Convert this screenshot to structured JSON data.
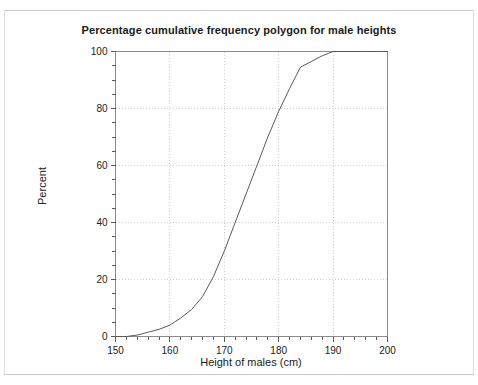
{
  "document": {
    "background_color": "#ffffff",
    "rule_color": "#c9c9c9"
  },
  "chart_data": {
    "type": "line",
    "title": "Percentage cumulative frequency polygon for male heights",
    "xlabel": "Height of males (cm)",
    "ylabel": "Percent",
    "xlim": [
      150,
      200
    ],
    "ylim": [
      0,
      100
    ],
    "x_major_ticks": [
      150,
      160,
      170,
      180,
      190,
      200
    ],
    "x_major_tick_labels": [
      "150",
      "160",
      "170",
      "180",
      "190",
      "200"
    ],
    "x_minor_tick_step": 2,
    "y_major_ticks": [
      0,
      20,
      40,
      60,
      80,
      100
    ],
    "y_major_tick_labels": [
      "0",
      "20",
      "40",
      "60",
      "80",
      "100"
    ],
    "y_minor_tick_step": 5,
    "grid": true,
    "grid_style": "dotted",
    "grid_color": "#cfcfcf",
    "legend": false,
    "line_color": "#5a5a5a",
    "line_width": 1,
    "frame_color": "#8a8a8a",
    "series": [
      {
        "name": "Cumulative percentage of male heights",
        "x": [
          150,
          152,
          154,
          156,
          158,
          160,
          162,
          164,
          166,
          168,
          170,
          172,
          174,
          176,
          178,
          180,
          182,
          184,
          186,
          188,
          190,
          192,
          194,
          196,
          198,
          200
        ],
        "values": [
          0,
          0,
          0.5,
          1.5,
          2.5,
          4,
          6.5,
          9.5,
          14,
          21,
          30,
          40,
          50,
          60,
          70,
          79,
          87,
          94.5,
          96.5,
          98.5,
          100,
          100,
          100,
          100,
          100,
          100
        ]
      }
    ]
  }
}
